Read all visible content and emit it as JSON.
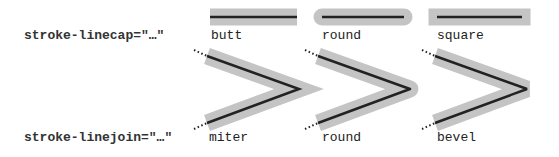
{
  "colors": {
    "outer_stroke": "#c4c4c4",
    "inner_stroke": "#222222",
    "dots": "#222222",
    "text": "#222222"
  },
  "linecap": {
    "label": "stroke-linecap=\"…\"",
    "items": [
      {
        "name": "butt",
        "label": "butt"
      },
      {
        "name": "round",
        "label": "round"
      },
      {
        "name": "square",
        "label": "square"
      }
    ]
  },
  "linejoin": {
    "label": "stroke-linejoin=\"…\"",
    "items": [
      {
        "name": "miter",
        "label": "miter"
      },
      {
        "name": "round",
        "label": "round"
      },
      {
        "name": "bevel",
        "label": "bevel"
      }
    ]
  }
}
